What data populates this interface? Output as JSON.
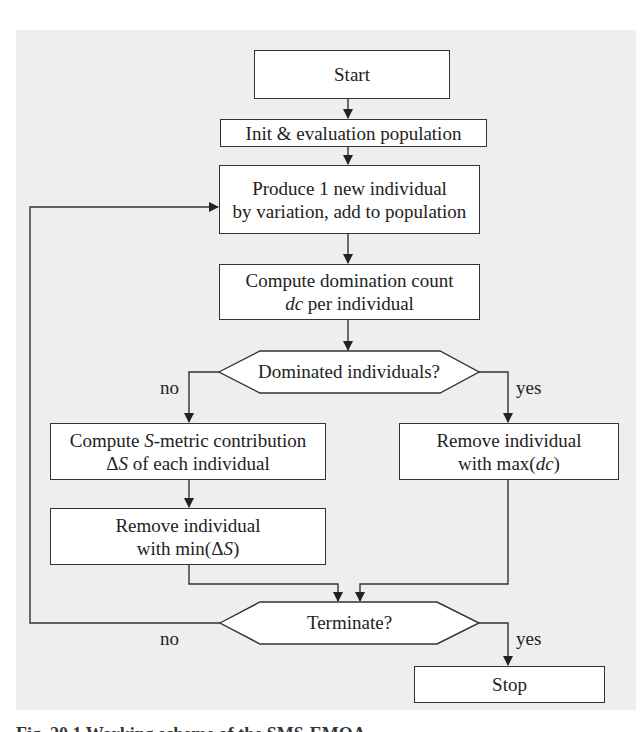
{
  "diagram": {
    "type": "flowchart",
    "background_color": "#eeeeee",
    "nodes": {
      "start": {
        "shape": "rect",
        "lines": [
          "Start"
        ]
      },
      "init": {
        "shape": "rect",
        "lines": [
          "Init & evaluation population"
        ]
      },
      "produce": {
        "shape": "rect",
        "lines": [
          "Produce 1 new individual",
          "by variation, add to population"
        ]
      },
      "domcount": {
        "shape": "rect",
        "line1": "Compute domination count",
        "line2_italic": "dc",
        "line2_rest": " per individual"
      },
      "dominated": {
        "shape": "hexagon",
        "label": "Dominated individuals?"
      },
      "smetric": {
        "shape": "rect",
        "line1_pre": "Compute ",
        "line1_italic": "S",
        "line1_post": "-metric contribution",
        "line2_pre": "Δ",
        "line2_italic": "S",
        "line2_post": " of each individual"
      },
      "removemax": {
        "shape": "rect",
        "line1": "Remove individual",
        "line2_pre": "with max(",
        "line2_italic": "dc",
        "line2_post": ")"
      },
      "removemin": {
        "shape": "rect",
        "line1": "Remove individual",
        "line2_pre": "with min(Δ",
        "line2_italic": "S",
        "line2_post": ")"
      },
      "terminate": {
        "shape": "hexagon",
        "label": "Terminate?"
      },
      "stop": {
        "shape": "rect",
        "lines": [
          "Stop"
        ]
      }
    },
    "edges": [
      {
        "from": "start",
        "to": "init",
        "label": ""
      },
      {
        "from": "init",
        "to": "produce",
        "label": ""
      },
      {
        "from": "produce",
        "to": "domcount",
        "label": ""
      },
      {
        "from": "domcount",
        "to": "dominated",
        "label": ""
      },
      {
        "from": "dominated",
        "to": "smetric",
        "label": "no"
      },
      {
        "from": "dominated",
        "to": "removemax",
        "label": "yes"
      },
      {
        "from": "smetric",
        "to": "removemin",
        "label": ""
      },
      {
        "from": "removemin",
        "to": "terminate",
        "label": ""
      },
      {
        "from": "removemax",
        "to": "terminate",
        "label": ""
      },
      {
        "from": "terminate",
        "to": "produce",
        "label": "no"
      },
      {
        "from": "terminate",
        "to": "stop",
        "label": "yes"
      }
    ],
    "edge_labels": {
      "dominated_no": "no",
      "dominated_yes": "yes",
      "terminate_no": "no",
      "terminate_yes": "yes"
    }
  },
  "caption": {
    "text": "Fig. 20.1 Working scheme of the SMS-EMOA"
  }
}
